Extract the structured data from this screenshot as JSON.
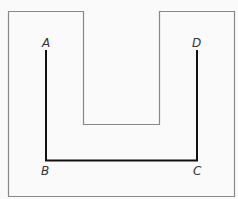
{
  "diagram": {
    "outline_color": "#888888",
    "path_color": "#111111",
    "background": "#fafafa",
    "points": [
      {
        "label": "A",
        "x": 47,
        "y": 50
      },
      {
        "label": "B",
        "x": 47,
        "y": 160
      },
      {
        "label": "C",
        "x": 197,
        "y": 160
      },
      {
        "label": "D",
        "x": 197,
        "y": 50
      }
    ]
  }
}
